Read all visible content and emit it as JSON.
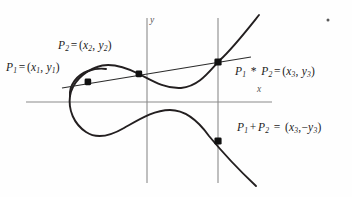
{
  "figure": {
    "background_color": "#fefefe",
    "curve_color": "#231f20",
    "line_color": "#2b2b2b",
    "axis_color": "#8a8a8a",
    "point_color": "#111111",
    "label_color": "#1b1b1b"
  },
  "axes": {
    "x_label": "x",
    "y_label": "y",
    "x_axis": {
      "x1": 26,
      "y1": 102,
      "x2": 272,
      "y2": 102
    },
    "y_axis": {
      "x1": 147,
      "y1": 18,
      "x2": 147,
      "y2": 183
    },
    "vertical_line": {
      "x1": 218,
      "y1": 18,
      "x2": 218,
      "y2": 183
    },
    "x_label_pos": {
      "x": 258,
      "y": 87
    },
    "y_label_pos": {
      "x": 150,
      "y": 18
    }
  },
  "labels": {
    "p1": {
      "name": "P",
      "sub": "1",
      "eq": "=",
      "open": "(",
      "v1": "x",
      "v1sub": "1",
      "comma": ",",
      "v2": "y",
      "v2sub": "1",
      "close": ")"
    },
    "p2": {
      "name": "P",
      "sub": "2",
      "eq": "=",
      "open": "(",
      "v1": "x",
      "v1sub": "2",
      "comma": ",",
      "v2": "y",
      "v2sub": "2",
      "close": ")"
    },
    "p1_star_p2": {
      "a": "P",
      "asub": "1",
      "op": "*",
      "b": "P",
      "bsub": "2",
      "eq": "=",
      "open": "(",
      "v1": "x",
      "v1sub": "3",
      "comma": ",",
      "v2": "y",
      "v2sub": "3",
      "close": ")"
    },
    "p1_plus_p2": {
      "a": "P",
      "asub": "1",
      "op": "+",
      "b": "P",
      "bsub": "2",
      "eq": "=",
      "open": "(",
      "v1": "x",
      "v1sub": "3",
      "comma": ",",
      "neg": "−",
      "v2": "y",
      "v2sub": "3",
      "close": ")"
    }
  },
  "label_text": {
    "p1": "P₁ = (x₁, y₁)",
    "p2": "P₂ = (x₂, y₂)",
    "p1_star_p2": "P₁ * P₂ = (x₃, y₃)",
    "p1_plus_p2": "P₁+P₂ = (x₃,−y₃)"
  },
  "points": [
    {
      "id": "p1",
      "label": "P1",
      "x": 88,
      "y": 82,
      "marker": "filled-square"
    },
    {
      "id": "p2",
      "label": "P2",
      "x": 139,
      "y": 74,
      "marker": "filled-square"
    },
    {
      "id": "p1_star_p2",
      "label": "P1*P2",
      "x": 218,
      "y": 62,
      "marker": "filled-square"
    },
    {
      "id": "p1_plus_p2",
      "label": "P1+P2",
      "x": 218,
      "y": 141,
      "marker": "filled-square"
    }
  ],
  "secant_line": {
    "x1": 62,
    "y1": 88,
    "x2": 250,
    "y2": 58
  },
  "curve": {
    "description": "Cubic elliptic curve with a closed left oval and an unbounded right branch",
    "upper_path": "M 258 16 C 244 32, 230 50, 218 62 C 206 75, 196 88, 178 88 C 160 88, 150 80, 139 74 C 124 66, 110 63, 96 68 C 82 73, 72 84, 70 96 C 68 108, 72 120, 82 129 C 92 138, 104 137, 116 132 C 134 124, 150 114, 166 110 C 184 106, 198 116, 208 128 C 222 145, 238 166, 255 185",
    "oval_close": "M 70 96 C 68 86, 76 76, 88 71"
  },
  "artifact_dot": {
    "x": 328,
    "y": 20,
    "size": 1.6
  }
}
